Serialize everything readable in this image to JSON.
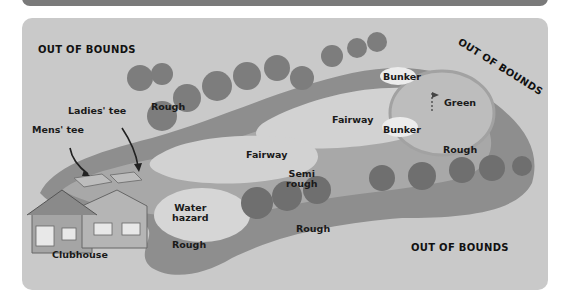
{
  "diagram": {
    "labels": {
      "out_of_bounds_top_left": "OUT OF BOUNDS",
      "out_of_bounds_top_right": "OUT OF BOUNDS",
      "out_of_bounds_bottom_right": "OUT OF BOUNDS",
      "ladies_tee": "Ladies' tee",
      "mens_tee": "Mens' tee",
      "rough_top_left": "Rough",
      "bunker_top": "Bunker",
      "green": "Green",
      "fairway_upper": "Fairway",
      "bunker_lower": "Bunker",
      "fairway_middle": "Fairway",
      "rough_right": "Rough",
      "semi_rough_line1": "Semi",
      "semi_rough_line2": "rough",
      "water_hazard_line1": "Water",
      "water_hazard_line2": "hazard",
      "rough_bottom_left": "Rough",
      "rough_bottom_middle": "Rough",
      "clubhouse": "Clubhouse"
    },
    "colors": {
      "top_bar": "#7a7a7a",
      "panel_background": "#c9c9c9",
      "rough": "#8e8e8e",
      "semi_rough": "#a8a8a8",
      "fairway": "#d2d2d2",
      "green": "#bdbdbd",
      "bunker": "#ececec",
      "water": "#d6d6d6",
      "trees": "#7d7d7d"
    }
  }
}
